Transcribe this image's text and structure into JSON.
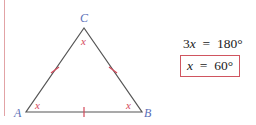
{
  "figure": {
    "vertices": [
      {
        "label": "A",
        "x": 26,
        "y": 112
      },
      {
        "label": "B",
        "x": 142,
        "y": 112
      },
      {
        "label": "C",
        "x": 84,
        "y": 28
      }
    ],
    "angle_labels": {
      "A": "x",
      "B": "x",
      "C": "x"
    },
    "tick_marks": "one tick on each side (equilateral)",
    "colors": {
      "lines": "#555555",
      "vertex_labels": "#5b6fb8",
      "angle_labels": "#d4485a",
      "ticks": "#d4485a",
      "margin_line": "#e2a3a6",
      "box": "#d05560"
    }
  },
  "equations": {
    "line1": {
      "lhs_coef": "3",
      "lhs_var": "x",
      "op": "=",
      "rhs": "180°"
    },
    "line2": {
      "lhs_var": "x",
      "op": "=",
      "rhs": "60°",
      "boxed": true
    }
  }
}
